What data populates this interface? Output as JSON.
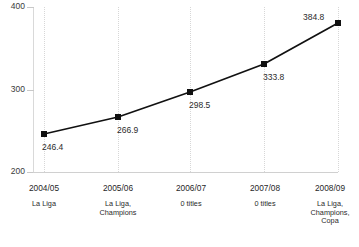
{
  "chart_data": {
    "type": "line",
    "title": "",
    "xlabel": "",
    "ylabel": "",
    "categories": [
      "2004/05",
      "2005/06",
      "2006/07",
      "2007/08",
      "2008/09"
    ],
    "values": [
      246.4,
      266.9,
      298.5,
      333.8,
      384.8
    ],
    "point_labels": [
      "246.4",
      "266.9",
      "298.5",
      "333.8",
      "384.8"
    ],
    "category_sublabels": [
      "La Liga",
      "La Liga,\nChampions",
      "0 titles",
      "0 titles",
      "La Liga,\nChampions,\nCopa"
    ],
    "ylim": [
      200,
      400
    ],
    "yticks": [
      200,
      300,
      400
    ],
    "ytick_labels": [
      "200",
      "300",
      "400"
    ],
    "grid": {
      "vertical": true,
      "horizontal": false,
      "style": "dotted"
    },
    "legend": null,
    "series_color": "#111111",
    "marker": "square",
    "marker_color": "#111111",
    "gridline_color": "#d7d7d7",
    "axis_color": "#d0d0d0"
  },
  "axis": {
    "y": {
      "t400": "400",
      "t300": "300",
      "t200": "200"
    }
  },
  "categories": [
    {
      "season": "2004/05",
      "titles": "La Liga"
    },
    {
      "season": "2005/06",
      "titles": "La Liga,\nChampions"
    },
    {
      "season": "2006/07",
      "titles": "0 titles"
    },
    {
      "season": "2007/08",
      "titles": "0 titles"
    },
    {
      "season": "2008/09",
      "titles": "La Liga,\nChampions,\nCopa"
    }
  ],
  "points": [
    {
      "label": "246.4"
    },
    {
      "label": "266.9"
    },
    {
      "label": "298.5"
    },
    {
      "label": "333.8"
    },
    {
      "label": "384.8"
    }
  ],
  "footnote": {
    "text": ""
  }
}
